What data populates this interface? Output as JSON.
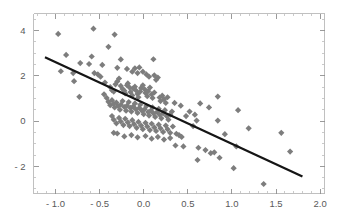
{
  "chart_data": {
    "type": "scatter",
    "title": "",
    "subtitle": "",
    "xlabel": "",
    "ylabel": "",
    "xlim": [
      -1.25,
      2.05
    ],
    "ylim": [
      -3.2,
      4.75
    ],
    "grid": false,
    "legend": null,
    "legend_position": "none",
    "marker_style": "diamond",
    "marker_color": "#7d7d7d",
    "marker_size": 4.2,
    "xticks": [
      -1.0,
      -0.5,
      0.0,
      0.5,
      1.0,
      1.5,
      2.0
    ],
    "xtick_labels": [
      "- 1.0",
      "- 0.5",
      "0.0",
      "0.5",
      "1.0",
      "1.5",
      "2.0"
    ],
    "yticks": [
      4,
      2,
      0,
      -2
    ],
    "ytick_labels": [
      "4",
      "2",
      "0",
      "- 2"
    ],
    "x_minor_step": 0.1,
    "y_minor_step": 0.5,
    "annotations": [],
    "series": [
      {
        "name": "observations",
        "type": "scatter",
        "color": "#7d7d7d",
        "points": [
          [
            -0.97,
            3.85
          ],
          [
            -0.57,
            4.08
          ],
          [
            -0.33,
            3.82
          ],
          [
            -0.4,
            3.28
          ],
          [
            -0.88,
            2.92
          ],
          [
            -0.59,
            2.85
          ],
          [
            -0.62,
            2.52
          ],
          [
            -0.72,
            2.56
          ],
          [
            -0.47,
            2.48
          ],
          [
            -0.26,
            2.72
          ],
          [
            0.11,
            2.73
          ],
          [
            -0.3,
            2.35
          ],
          [
            -0.19,
            2.3
          ],
          [
            -0.1,
            2.33
          ],
          [
            -0.05,
            2.37
          ],
          [
            -0.01,
            2.18
          ],
          [
            -0.94,
            2.2
          ],
          [
            -0.8,
            2.12
          ],
          [
            -0.56,
            2.12
          ],
          [
            -0.52,
            2.06
          ],
          [
            -0.79,
            1.76
          ],
          [
            -0.73,
            1.07
          ],
          [
            -0.49,
            1.96
          ],
          [
            -0.44,
            1.7
          ],
          [
            -0.38,
            1.5
          ],
          [
            -0.36,
            1.36
          ],
          [
            -0.34,
            1.3
          ],
          [
            -0.32,
            1.62
          ],
          [
            -0.3,
            1.75
          ],
          [
            -0.28,
            1.88
          ],
          [
            -0.26,
            1.55
          ],
          [
            -0.24,
            1.42
          ],
          [
            -0.22,
            1.34
          ],
          [
            -0.21,
            1.22
          ],
          [
            -0.19,
            1.58
          ],
          [
            -0.18,
            1.66
          ],
          [
            -0.16,
            1.48
          ],
          [
            -0.15,
            1.28
          ],
          [
            -0.13,
            1.13
          ],
          [
            -0.12,
            1.44
          ],
          [
            -0.1,
            1.52
          ],
          [
            -0.09,
            1.36
          ],
          [
            -0.07,
            1.2
          ],
          [
            -0.06,
            1.05
          ],
          [
            -0.04,
            1.3
          ],
          [
            -0.03,
            1.46
          ],
          [
            -0.01,
            1.58
          ],
          [
            0.01,
            1.4
          ],
          [
            0.02,
            1.24
          ],
          [
            0.04,
            1.1
          ],
          [
            0.05,
            1.32
          ],
          [
            0.07,
            1.48
          ],
          [
            0.09,
            1.18
          ],
          [
            0.1,
            1.02
          ],
          [
            0.12,
            1.26
          ],
          [
            0.14,
            1.82
          ],
          [
            0.16,
            1.92
          ],
          [
            0.18,
            1.04
          ],
          [
            0.19,
            0.88
          ],
          [
            0.21,
            1.12
          ],
          [
            0.23,
            0.96
          ],
          [
            0.25,
            0.8
          ],
          [
            0.27,
            1.05
          ],
          [
            0.03,
            2.06
          ],
          [
            0.06,
            1.96
          ],
          [
            0.12,
            2.02
          ],
          [
            -0.13,
            2.18
          ],
          [
            -0.07,
            2.12
          ],
          [
            -0.45,
            1.18
          ],
          [
            -0.42,
            1.02
          ],
          [
            -0.4,
            0.85
          ],
          [
            -0.38,
            0.7
          ],
          [
            -0.36,
            0.92
          ],
          [
            -0.34,
            0.76
          ],
          [
            -0.33,
            0.6
          ],
          [
            -0.31,
            0.82
          ],
          [
            -0.29,
            0.66
          ],
          [
            -0.27,
            0.5
          ],
          [
            -0.26,
            0.72
          ],
          [
            -0.24,
            0.88
          ],
          [
            -0.22,
            0.62
          ],
          [
            -0.2,
            0.46
          ],
          [
            -0.19,
            0.68
          ],
          [
            -0.17,
            0.84
          ],
          [
            -0.15,
            0.58
          ],
          [
            -0.14,
            0.42
          ],
          [
            -0.12,
            0.64
          ],
          [
            -0.1,
            0.78
          ],
          [
            -0.09,
            0.52
          ],
          [
            -0.07,
            0.36
          ],
          [
            -0.05,
            0.58
          ],
          [
            -0.04,
            0.72
          ],
          [
            -0.02,
            0.46
          ],
          [
            0.0,
            0.3
          ],
          [
            0.01,
            0.52
          ],
          [
            0.03,
            0.66
          ],
          [
            0.05,
            0.4
          ],
          [
            0.06,
            0.24
          ],
          [
            0.08,
            0.46
          ],
          [
            0.1,
            0.6
          ],
          [
            0.11,
            0.34
          ],
          [
            0.13,
            0.18
          ],
          [
            0.15,
            0.4
          ],
          [
            0.17,
            0.54
          ],
          [
            0.18,
            0.28
          ],
          [
            0.2,
            0.12
          ],
          [
            0.22,
            0.34
          ],
          [
            0.24,
            0.48
          ],
          [
            0.26,
            0.22
          ],
          [
            0.28,
            0.06
          ],
          [
            0.3,
            0.28
          ],
          [
            0.32,
            0.42
          ],
          [
            -0.36,
            0.22
          ],
          [
            -0.34,
            0.06
          ],
          [
            -0.31,
            -0.1
          ],
          [
            -0.28,
            0.14
          ],
          [
            -0.26,
            -0.02
          ],
          [
            -0.23,
            -0.18
          ],
          [
            -0.21,
            0.1
          ],
          [
            -0.18,
            -0.06
          ],
          [
            -0.16,
            -0.22
          ],
          [
            -0.13,
            0.04
          ],
          [
            -0.11,
            -0.14
          ],
          [
            -0.08,
            -0.3
          ],
          [
            -0.06,
            -0.04
          ],
          [
            -0.03,
            -0.2
          ],
          [
            -0.01,
            -0.36
          ],
          [
            0.02,
            -0.08
          ],
          [
            0.04,
            -0.24
          ],
          [
            0.07,
            -0.4
          ],
          [
            0.09,
            -0.12
          ],
          [
            0.12,
            -0.28
          ],
          [
            0.14,
            -0.44
          ],
          [
            0.17,
            -0.16
          ],
          [
            0.19,
            -0.32
          ],
          [
            0.22,
            -0.48
          ],
          [
            0.25,
            -0.2
          ],
          [
            0.27,
            -0.36
          ],
          [
            0.3,
            -0.52
          ],
          [
            0.33,
            -0.24
          ],
          [
            -0.34,
            -0.52
          ],
          [
            -0.3,
            -0.55
          ],
          [
            -0.22,
            -0.68
          ],
          [
            -0.14,
            -0.62
          ],
          [
            -0.07,
            -0.72
          ],
          [
            0.02,
            -0.66
          ],
          [
            0.09,
            -0.78
          ],
          [
            0.16,
            -0.7
          ],
          [
            0.23,
            -0.82
          ],
          [
            0.3,
            -0.75
          ],
          [
            0.37,
            -0.56
          ],
          [
            0.4,
            -0.62
          ],
          [
            0.43,
            -0.7
          ],
          [
            0.36,
            -1.08
          ],
          [
            0.45,
            -1.12
          ],
          [
            0.35,
            0.8
          ],
          [
            0.42,
            0.68
          ],
          [
            0.48,
            0.22
          ],
          [
            0.52,
            0.42
          ],
          [
            0.56,
            -0.22
          ],
          [
            0.58,
            0.28
          ],
          [
            0.6,
            0.02
          ],
          [
            0.62,
            -1.18
          ],
          [
            0.61,
            -1.72
          ],
          [
            0.64,
            0.78
          ],
          [
            0.7,
            -1.28
          ],
          [
            0.74,
            0.6
          ],
          [
            0.76,
            -1.42
          ],
          [
            0.8,
            -1.38
          ],
          [
            0.84,
            1.08
          ],
          [
            0.84,
            0.02
          ],
          [
            0.86,
            -1.62
          ],
          [
            0.92,
            -0.58
          ],
          [
            1.02,
            -2.08
          ],
          [
            1.05,
            -1.12
          ],
          [
            1.07,
            0.48
          ],
          [
            1.19,
            -0.32
          ],
          [
            1.36,
            -2.78
          ],
          [
            1.56,
            -0.52
          ],
          [
            1.66,
            -1.35
          ]
        ]
      }
    ],
    "fit_line": {
      "name": "least-squares-fit",
      "color": "#151515",
      "x_start": -1.12,
      "y_start": 2.82,
      "x_end": 1.8,
      "y_end": -2.45,
      "slope": -1.805,
      "intercept": 0.79
    }
  }
}
